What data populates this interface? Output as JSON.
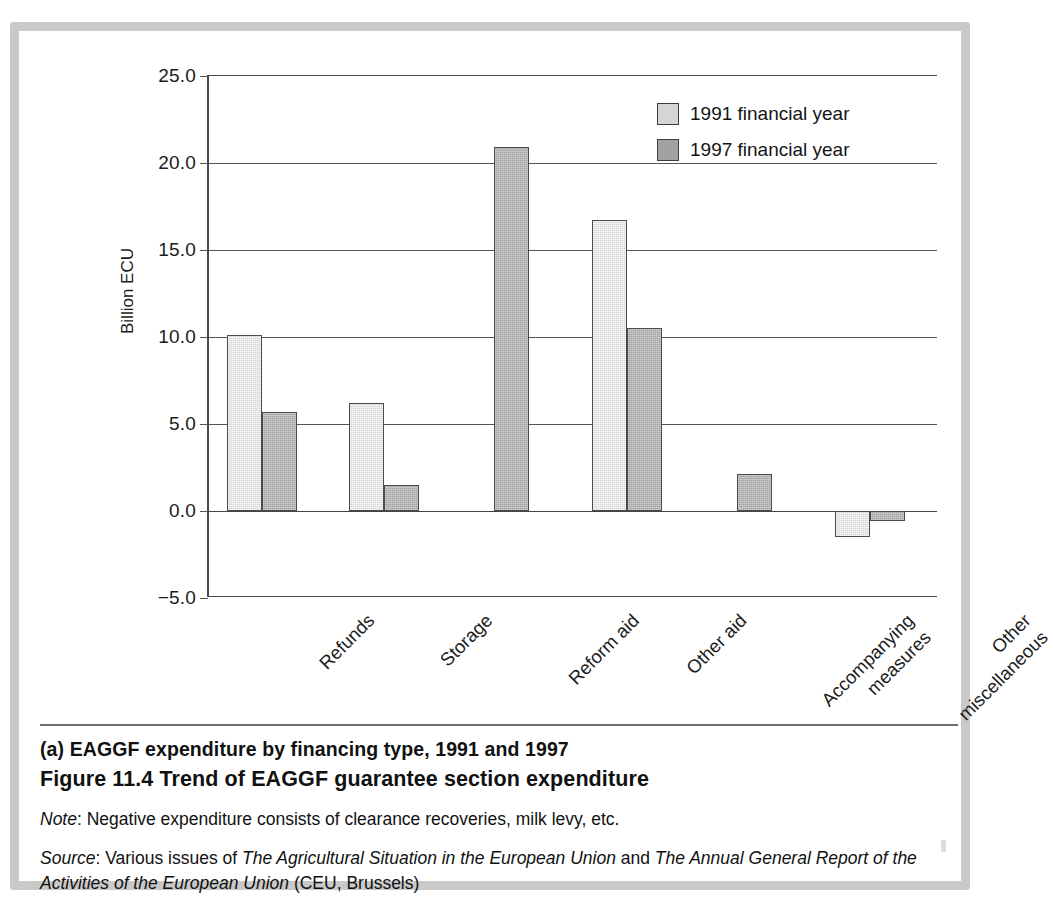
{
  "chart_data": {
    "type": "bar",
    "title": "EAGGF expenditure by financing type, 1991 and 1997",
    "xlabel": "",
    "ylabel": "Billion ECU",
    "ylim": [
      -5.0,
      25.0
    ],
    "ytick_labels": [
      "25.0",
      "20.0",
      "15.0",
      "10.0",
      "5.0",
      "0.0",
      "−5.0"
    ],
    "ytick_values": [
      25.0,
      20.0,
      15.0,
      10.0,
      5.0,
      0.0,
      -5.0
    ],
    "grid": true,
    "legend_position": "top-right",
    "categories": [
      "Refunds",
      "Storage",
      "Reform aid",
      "Other aid",
      "Accompanying measures",
      "Other miscellaneous"
    ],
    "category_lines": [
      [
        "Refunds"
      ],
      [
        "Storage"
      ],
      [
        "Reform aid"
      ],
      [
        "Other aid"
      ],
      [
        "Accompanying",
        "measures"
      ],
      [
        "Other",
        "miscellaneous"
      ]
    ],
    "series": [
      {
        "name": "1991 financial year",
        "color": "#d5d5d5",
        "values": [
          10.1,
          6.2,
          null,
          16.7,
          null,
          -1.5
        ]
      },
      {
        "name": "1997 financial year",
        "color": "#a2a2a2",
        "values": [
          5.7,
          1.5,
          20.9,
          10.5,
          2.1,
          -0.6
        ]
      }
    ]
  },
  "legend": {
    "items": [
      {
        "label": "1991 financial year",
        "swatch": "#d5d5d5"
      },
      {
        "label": "1997 financial year",
        "swatch": "#a2a2a2"
      }
    ]
  },
  "caption": {
    "part_label": "(a) EAGGF expenditure by financing type, 1991 and 1997",
    "figure_label": "Figure 11.4  Trend of EAGGF guarantee section expenditure",
    "note_prefix": "Note",
    "note_text": ": Negative expenditure consists of clearance recoveries, milk levy, etc.",
    "source_prefix": "Source",
    "source_lead": ": Various issues of ",
    "source_title_1": "The Agricultural Situation in the European Union",
    "source_conj": " and ",
    "source_title_2": "The Annual General Report of the Activities of the European Union",
    "source_tail": " (CEU, Brussels)"
  },
  "colors": {
    "frame": "#c9c9c9",
    "axis": "#4a4a4a",
    "series_1991": "#d5d5d5",
    "series_1997": "#a2a2a2"
  }
}
